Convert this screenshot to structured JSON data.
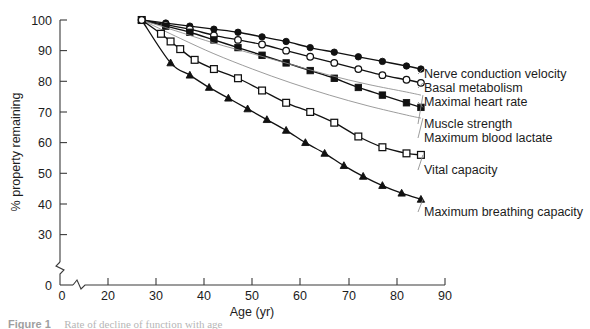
{
  "figure": {
    "caption_number": "Figure 1",
    "caption_text": "Rate of decline of function with age"
  },
  "chart_data": {
    "type": "line",
    "title": "",
    "xlabel": "Age (yr)",
    "ylabel": "% property remaining",
    "xlim": [
      0,
      90
    ],
    "ylim": [
      0,
      100
    ],
    "grid": false,
    "axis_break_x": true,
    "axis_break_y": true,
    "legend_position": "right",
    "xticks": [
      0,
      20,
      30,
      40,
      50,
      60,
      70,
      80,
      90
    ],
    "xtick_labels": [
      "0",
      "20",
      "30",
      "40",
      "50",
      "60",
      "70",
      "80",
      "90"
    ],
    "yticks": [
      0,
      30,
      40,
      50,
      60,
      70,
      80,
      90,
      100
    ],
    "ytick_labels": [
      "0",
      "30",
      "40",
      "50",
      "60",
      "70",
      "80",
      "90",
      "100"
    ],
    "series": [
      {
        "name": "Nerve conduction velocity",
        "marker": "filled-circle",
        "x": [
          27,
          32,
          37,
          42,
          47,
          52,
          57,
          62,
          67,
          72,
          77,
          82,
          85
        ],
        "values": [
          100,
          99,
          98,
          97,
          96,
          94.5,
          93,
          91,
          89.5,
          88,
          86.5,
          85,
          84
        ]
      },
      {
        "name": "Basal metabolism",
        "marker": "open-circle",
        "x": [
          27,
          32,
          37,
          42,
          47,
          52,
          57,
          62,
          67,
          72,
          77,
          82,
          85
        ],
        "values": [
          100,
          98.5,
          97,
          95,
          93.5,
          92,
          90,
          88,
          86,
          84,
          82,
          80.5,
          79.5
        ]
      },
      {
        "name": "Maximal heart rate",
        "marker": "filled-square",
        "x": [
          27,
          32,
          37,
          42,
          47,
          52,
          57,
          62,
          67,
          72,
          77,
          82,
          85
        ],
        "values": [
          100,
          98,
          96,
          93.5,
          91,
          88.5,
          86,
          83.5,
          81,
          78,
          75.5,
          73,
          71.5
        ]
      },
      {
        "name": "Muscle strength",
        "marker": "none",
        "x": [
          27,
          35,
          42,
          50,
          58,
          66,
          74,
          82,
          85
        ],
        "values": [
          100,
          96,
          92.5,
          89,
          85.5,
          82,
          79,
          76.5,
          75.5
        ]
      },
      {
        "name": "Maximum blood lactate",
        "marker": "none",
        "x": [
          27,
          35,
          42,
          50,
          58,
          66,
          74,
          82,
          85
        ],
        "values": [
          100,
          94,
          89,
          84,
          79.5,
          75.5,
          72,
          69,
          68
        ]
      },
      {
        "name": "Vital capacity",
        "marker": "open-square",
        "x": [
          27,
          31,
          33,
          35,
          38,
          42,
          47,
          52,
          57,
          62,
          67,
          72,
          77,
          82,
          85
        ],
        "values": [
          100,
          95.5,
          93,
          90.5,
          87,
          84,
          81,
          77,
          73,
          70,
          66.5,
          62,
          58.5,
          56.5,
          56
        ]
      },
      {
        "name": "Maximum breathing capacity",
        "marker": "filled-triangle",
        "x": [
          27,
          33,
          37,
          41,
          45,
          49,
          53,
          57,
          61,
          65,
          69,
          73,
          77,
          81,
          85
        ],
        "values": [
          100,
          86,
          82,
          78,
          74.5,
          71,
          67.5,
          64,
          60,
          56.5,
          52.5,
          49,
          46,
          43.5,
          41.5
        ]
      }
    ],
    "legend_entries": [
      {
        "label": "Nerve conduction velocity",
        "marker": "filled-circle"
      },
      {
        "label": "Basal metabolism",
        "marker": "open-circle"
      },
      {
        "label": "Maximal heart rate",
        "marker": "filled-square"
      },
      {
        "label": "Muscle strength",
        "marker": "none"
      },
      {
        "label": "Maximum blood lactate",
        "marker": "none"
      },
      {
        "label": "Vital capacity",
        "marker": "open-square"
      },
      {
        "label": "Maximum breathing capacity",
        "marker": "filled-triangle"
      }
    ]
  }
}
